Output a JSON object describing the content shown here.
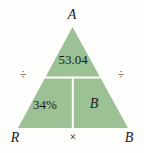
{
  "figure": {
    "type": "partitioned-triangle-diagram",
    "colors": {
      "fill": "#9cc195",
      "divider": "#ffffff",
      "text": "#1b1b1b",
      "background": "#ffffff"
    },
    "triangle": {
      "apex_label": "A",
      "bottom_left_label": "R",
      "bottom_right_label": "B"
    },
    "cells": {
      "top": "53.04",
      "bottom_left": "34%",
      "bottom_right": "B"
    },
    "operators": {
      "left": "÷",
      "right": "÷",
      "bottom": "×"
    },
    "icon_names": {
      "left": "division-icon",
      "right": "division-icon",
      "bottom": "multiplication-icon"
    }
  }
}
